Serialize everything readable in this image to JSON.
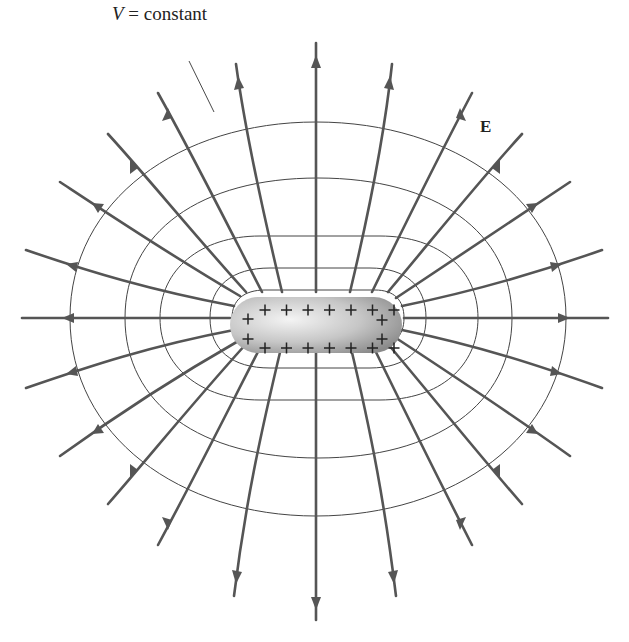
{
  "figure": {
    "labels": {
      "equipotential_var": "V",
      "equipotential_rest": " = constant",
      "field": "E"
    },
    "conductor": {
      "charge_symbol": "+",
      "top_charges": 7,
      "bottom_charges": 7,
      "left_charges": 2,
      "right_charges": 2
    },
    "colors": {
      "field_line": "#555555",
      "equipotential": "#444444",
      "conductor_light": "#f2f2f2",
      "conductor_dark": "#8a8a8a"
    },
    "field_line_count": 22,
    "equipotential_count": 5
  }
}
